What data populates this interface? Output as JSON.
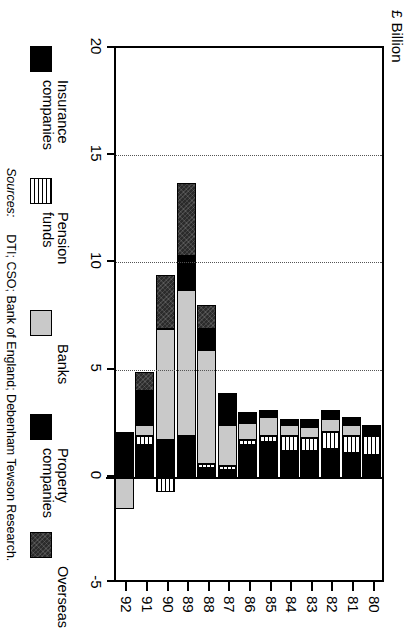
{
  "axis_title": "£  Billion",
  "sources_label": "Sources:",
  "sources_text": "DTI; CSO; Bank of England; Debenham Tewson Research.",
  "legend": [
    {
      "key": "insurance",
      "label": "Insurance\ncompanies",
      "color": "#000000"
    },
    {
      "key": "pension",
      "label": "Pension\nfunds",
      "color": "#ffffff"
    },
    {
      "key": "banks",
      "label": "Banks",
      "color": "#c9c9c9"
    },
    {
      "key": "property",
      "label": "Property\ncompanies",
      "color": "#000000"
    },
    {
      "key": "overseas",
      "label": "Overseas",
      "color": "#2b2b2b"
    }
  ],
  "chart_data": {
    "type": "bar",
    "orientation": "horizontal-stacked",
    "title": "",
    "xlabel": "£  Billion",
    "ylabel": "",
    "xlim": [
      -5,
      20
    ],
    "xticks": [
      20,
      15,
      10,
      5,
      0,
      -5
    ],
    "xticklabels": [
      "20",
      "15",
      "10",
      "5",
      "0",
      "-5"
    ],
    "grid": "dotted vertical gridlines at 5, 10, 15",
    "legend_position": "below plot",
    "categories": [
      "80",
      "81",
      "82",
      "83",
      "84",
      "85",
      "86",
      "87",
      "88",
      "89",
      "90",
      "91",
      "92"
    ],
    "series": [
      {
        "name": "Insurance companies",
        "values": [
          1.0,
          1.1,
          1.3,
          1.2,
          1.2,
          1.6,
          1.5,
          0.3,
          0.4,
          1.9,
          1.7,
          1.5,
          2.1
        ]
      },
      {
        "name": "Pension funds",
        "values": [
          0.9,
          0.8,
          0.8,
          0.6,
          0.7,
          0.3,
          0.2,
          0.2,
          0.2,
          0.0,
          -0.7,
          0.4,
          0.0
        ]
      },
      {
        "name": "Banks",
        "values": [
          0.0,
          0.5,
          0.6,
          0.5,
          0.5,
          0.9,
          0.8,
          1.9,
          5.3,
          6.8,
          5.2,
          0.5,
          -1.5
        ]
      },
      {
        "name": "Property companies",
        "values": [
          0.5,
          0.4,
          0.4,
          0.4,
          0.3,
          0.3,
          0.5,
          1.5,
          1.0,
          1.6,
          0.0,
          1.6,
          0.0
        ]
      },
      {
        "name": "Overseas",
        "values": [
          0.0,
          0.0,
          0.0,
          0.0,
          0.0,
          0.0,
          0.0,
          0.0,
          1.1,
          3.4,
          2.5,
          0.9,
          0.0
        ]
      }
    ],
    "totals": [
      2.4,
      2.8,
      3.1,
      2.7,
      2.7,
      3.1,
      3.0,
      3.9,
      8.0,
      13.7,
      8.7,
      4.9,
      2.1
    ]
  }
}
